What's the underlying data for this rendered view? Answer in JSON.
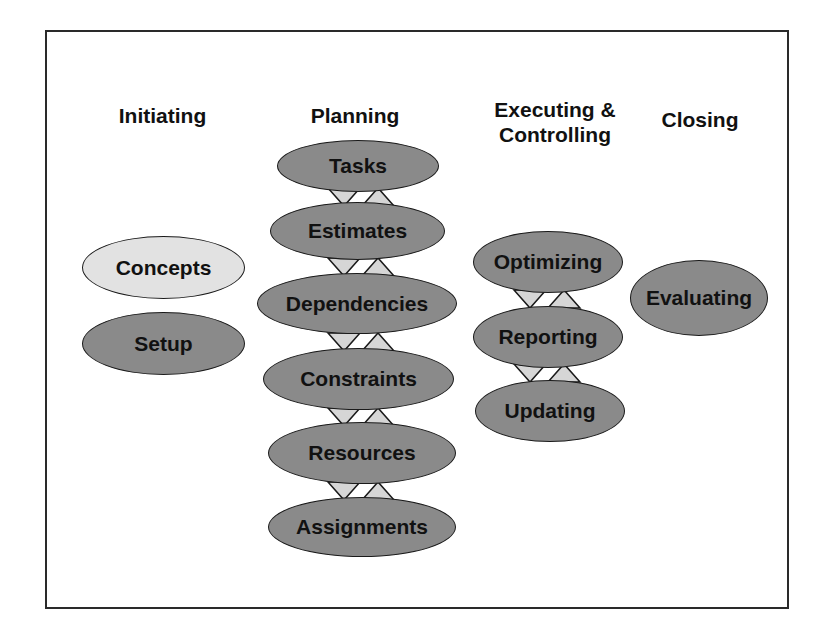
{
  "colors": {
    "node_fill": "#8a8a8a",
    "node_highlight_fill": "#e2e2e2",
    "arrow_fill": "#d6d6d6",
    "border": "#1a1a1a"
  },
  "columns": [
    {
      "heading": "Initiating",
      "nodes": [
        {
          "label": "Concepts",
          "highlighted": true
        },
        {
          "label": "Setup",
          "highlighted": false
        }
      ]
    },
    {
      "heading": "Planning",
      "nodes": [
        {
          "label": "Tasks"
        },
        {
          "label": "Estimates"
        },
        {
          "label": "Dependencies"
        },
        {
          "label": "Constraints"
        },
        {
          "label": "Resources"
        },
        {
          "label": "Assignments"
        }
      ]
    },
    {
      "heading": "Executing & Controlling",
      "heading_lines": [
        "Executing &",
        "Controlling"
      ],
      "nodes": [
        {
          "label": "Optimizing"
        },
        {
          "label": "Reporting"
        },
        {
          "label": "Updating"
        }
      ]
    },
    {
      "heading": "Closing",
      "nodes": [
        {
          "label": "Evaluating"
        }
      ]
    }
  ]
}
